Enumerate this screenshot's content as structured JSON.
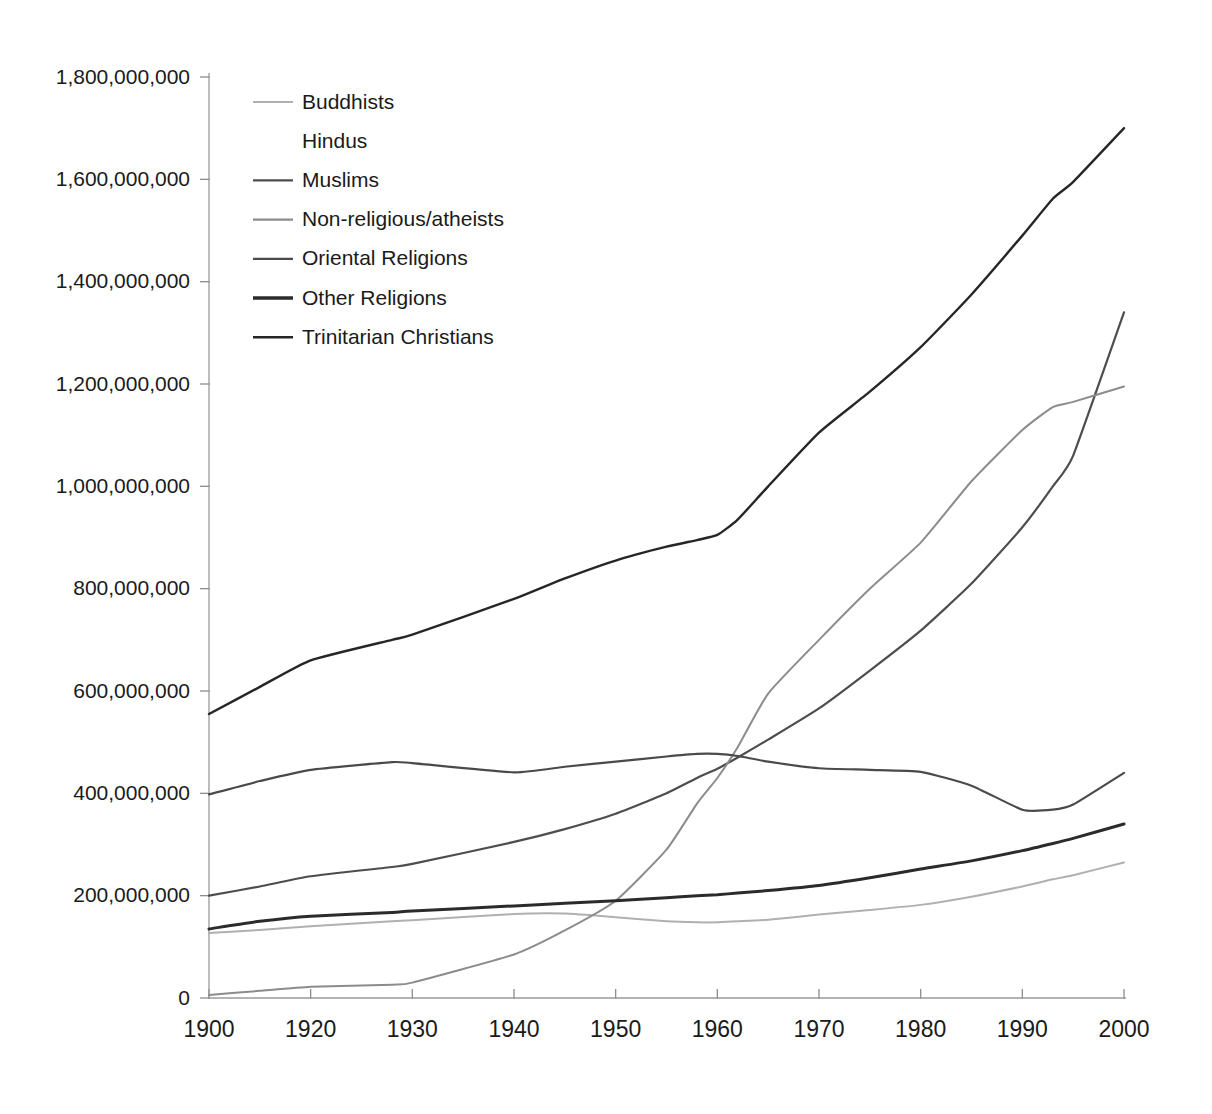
{
  "chart_data": {
    "type": "line",
    "title": "",
    "subtitle": "",
    "xlabel": "",
    "ylabel": "",
    "xlim": [
      1900,
      2000
    ],
    "ylim": [
      0,
      1800000000
    ],
    "grid": false,
    "legend_position": "top-left",
    "x_ticks": [
      1900,
      1920,
      1930,
      1940,
      1950,
      1960,
      1970,
      1980,
      1990,
      2000
    ],
    "x_tick_labels": [
      "1900",
      "1920",
      "1930",
      "1940",
      "1950",
      "1960",
      "1970",
      "1980",
      "1990",
      "2000"
    ],
    "y_ticks": [
      0,
      200000000,
      400000000,
      600000000,
      800000000,
      1000000000,
      1200000000,
      1400000000,
      1600000000,
      1800000000
    ],
    "y_tick_labels": [
      "0",
      "200,000,000",
      "400,000,000",
      "600,000,000",
      "800,000,000",
      "1,000,000,000",
      "1,200,000,000",
      "1,400,000,000",
      "1,600,000,000",
      "1,800,000,000"
    ],
    "x": [
      1900,
      1910,
      1920,
      1928,
      1930,
      1940,
      1945,
      1950,
      1955,
      1958,
      1960,
      1962,
      1965,
      1970,
      1975,
      1980,
      1985,
      1990,
      1993,
      1995,
      2000
    ],
    "series": [
      {
        "name": "Buddhists",
        "color": "#b0b0b0",
        "width": 2.0,
        "values": [
          127000000,
          133000000,
          140000000,
          150000000,
          152000000,
          164000000,
          165000000,
          158000000,
          150000000,
          148000000,
          148000000,
          150000000,
          153000000,
          163000000,
          172000000,
          182000000,
          198000000,
          218000000,
          232000000,
          240000000,
          265000000
        ]
      },
      {
        "name": "Hindus",
        "color": "#ffffff",
        "width": 2.0,
        "values": [
          null,
          null,
          null,
          null,
          null,
          null,
          null,
          null,
          null,
          null,
          null,
          null,
          null,
          null,
          null,
          null,
          null,
          null,
          null,
          null,
          null
        ]
      },
      {
        "name": "Muslims",
        "color": "#4d4d4d",
        "width": 2.2,
        "values": [
          200000000,
          218000000,
          238000000,
          256000000,
          262000000,
          305000000,
          330000000,
          360000000,
          400000000,
          430000000,
          448000000,
          470000000,
          505000000,
          566000000,
          640000000,
          718000000,
          810000000,
          920000000,
          1000000000,
          1060000000,
          1340000000
        ]
      },
      {
        "name": "Non-religious/atheists",
        "color": "#8c8c8c",
        "width": 2.0,
        "values": [
          6000000,
          14000000,
          22000000,
          26000000,
          30000000,
          85000000,
          132000000,
          190000000,
          290000000,
          380000000,
          430000000,
          490000000,
          595000000,
          700000000,
          800000000,
          890000000,
          1010000000,
          1110000000,
          1155000000,
          1165000000,
          1195000000
        ]
      },
      {
        "name": "Oriental Religions",
        "color": "#4a4a4a",
        "width": 2.2,
        "values": [
          398000000,
          424000000,
          446000000,
          461000000,
          459000000,
          441000000,
          452000000,
          462000000,
          472000000,
          477000000,
          477000000,
          473000000,
          462000000,
          449000000,
          446000000,
          442000000,
          415000000,
          368000000,
          368000000,
          378000000,
          440000000
        ]
      },
      {
        "name": "Other Religions",
        "color": "#2b2b2b",
        "width": 3.0,
        "values": [
          135000000,
          150000000,
          160000000,
          167000000,
          170000000,
          180000000,
          185000000,
          190000000,
          196000000,
          200000000,
          202000000,
          205000000,
          210000000,
          220000000,
          235000000,
          252000000,
          268000000,
          288000000,
          302000000,
          312000000,
          340000000
        ]
      },
      {
        "name": "Trinitarian Christians",
        "color": "#262626",
        "width": 2.4,
        "values": [
          555000000,
          608000000,
          660000000,
          700000000,
          710000000,
          780000000,
          820000000,
          855000000,
          882000000,
          895000000,
          905000000,
          935000000,
          1000000000,
          1105000000,
          1185000000,
          1272000000,
          1375000000,
          1490000000,
          1562000000,
          1595000000,
          1700000000
        ]
      }
    ]
  },
  "legend": {
    "items": [
      {
        "label": "Buddhists",
        "color": "#b0b0b0",
        "width": 2.0
      },
      {
        "label": "Hindus",
        "color": "#ffffff",
        "width": 2.0
      },
      {
        "label": "Muslims",
        "color": "#4d4d4d",
        "width": 2.2
      },
      {
        "label": "Non-religious/atheists",
        "color": "#8c8c8c",
        "width": 2.4
      },
      {
        "label": "Oriental Religions",
        "color": "#4a4a4a",
        "width": 2.2
      },
      {
        "label": "Other Religions",
        "color": "#2b2b2b",
        "width": 3.4
      },
      {
        "label": "Trinitarian Christians",
        "color": "#262626",
        "width": 2.4
      }
    ]
  },
  "axes": {
    "axis_color": "#9a9a9a",
    "tick_color": "#8d8d8d",
    "label_color": "#1a1a1a"
  }
}
